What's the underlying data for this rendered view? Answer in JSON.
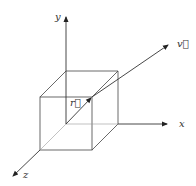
{
  "diagram": {
    "type": "3d-coordinate-system",
    "axes": [
      {
        "name": "x",
        "label": "x"
      },
      {
        "name": "y",
        "label": "y"
      },
      {
        "name": "z",
        "label": "z"
      }
    ],
    "vectors": [
      {
        "name": "r",
        "label": "r⃗"
      },
      {
        "name": "v",
        "label": "v⃗"
      }
    ],
    "shape": "cube",
    "colors": {
      "line": "#333333",
      "background": "#ffffff"
    }
  }
}
